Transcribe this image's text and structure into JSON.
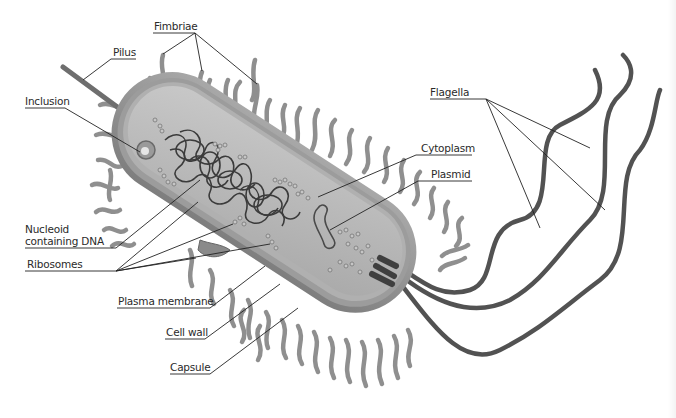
{
  "diagram": {
    "colors": {
      "background": "#ffffff",
      "label_text": "#2a2a2a",
      "leader_line": "#222222",
      "capsule": "#9a9a9a",
      "cell_wall": "#8c8c8c",
      "cytoplasm": "#bdbdbd",
      "fimbriae": "#8f8f8f",
      "flagella": "#505050",
      "dna": "#3a3a3a"
    },
    "labels": [
      {
        "id": "fimbriae",
        "text": "Fimbriae"
      },
      {
        "id": "pilus",
        "text": "Pilus"
      },
      {
        "id": "inclusion",
        "text": "Inclusion"
      },
      {
        "id": "flagella",
        "text": "Flagella"
      },
      {
        "id": "cytoplasm",
        "text": "Cytoplasm"
      },
      {
        "id": "plasmid",
        "text": "Plasmid"
      },
      {
        "id": "nucleoid_line1",
        "text": "Nucleoid"
      },
      {
        "id": "nucleoid_line2",
        "text": "containing DNA"
      },
      {
        "id": "ribosomes",
        "text": "Ribosomes"
      },
      {
        "id": "plasma_membrane",
        "text": "Plasma membrane"
      },
      {
        "id": "cell_wall",
        "text": "Cell wall"
      },
      {
        "id": "capsule",
        "text": "Capsule"
      }
    ]
  }
}
